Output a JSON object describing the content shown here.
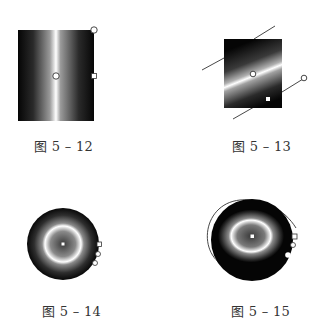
{
  "figures": [
    {
      "id": "fig-5-12",
      "caption": "图 5 – 12",
      "type": "linear-gradient-vertical-band"
    },
    {
      "id": "fig-5-13",
      "caption": "图 5 – 13",
      "type": "linear-gradient-diagonal-band"
    },
    {
      "id": "fig-5-14",
      "caption": "图 5 – 14",
      "type": "radial-gradient-ring"
    },
    {
      "id": "fig-5-15",
      "caption": "图 5 – 15",
      "type": "radial-gradient-ellipse-ring"
    }
  ],
  "colors": {
    "dark": "#0a0a0a",
    "light": "#ffffff",
    "line": "#333333",
    "caption": "#333333"
  }
}
